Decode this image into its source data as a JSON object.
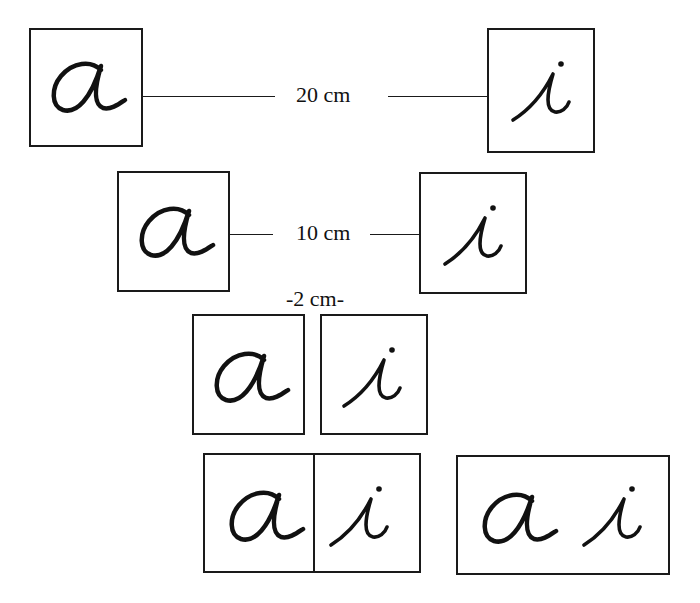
{
  "diagram": {
    "colors": {
      "ink": "#111111",
      "background": "#ffffff"
    },
    "letters": {
      "a": "a",
      "i": "i"
    },
    "rows": [
      {
        "id": "row-20cm",
        "distance_label": "20 cm",
        "description": "Letters a and i placed 20 cm apart"
      },
      {
        "id": "row-10cm",
        "distance_label": "10 cm",
        "description": "Letters a and i placed 10 cm apart"
      },
      {
        "id": "row-2cm",
        "distance_label": "-2 cm-",
        "description": "Letters a and i placed 2 cm apart"
      },
      {
        "id": "row-joined",
        "description": "Letters a and i touching, then combined in a single card"
      }
    ]
  }
}
